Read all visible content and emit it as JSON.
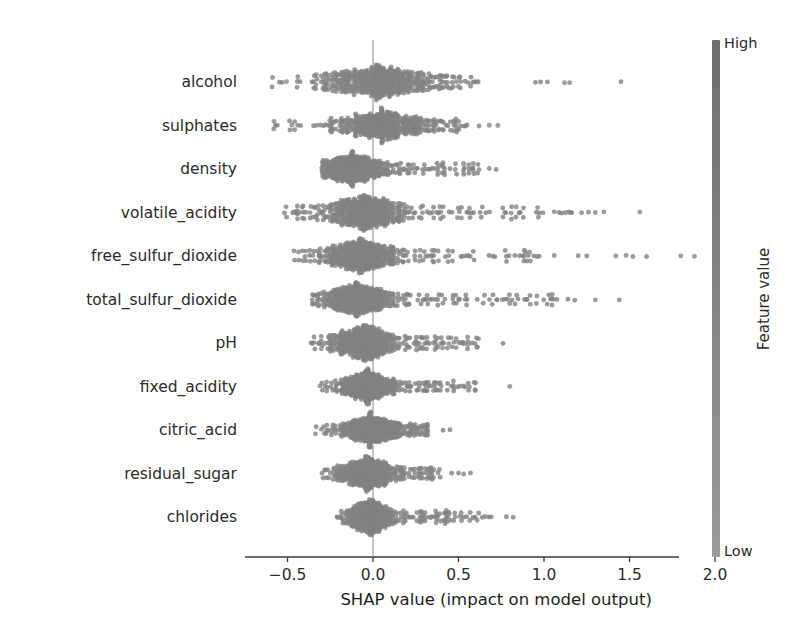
{
  "chart_data": {
    "type": "scatter",
    "plot_kind": "shap-beeswarm",
    "title": "",
    "xlabel": "SHAP value (impact on model output)",
    "ylabel": "",
    "xlim": [
      -0.78,
      2.02
    ],
    "xticks": [
      -0.5,
      0.0,
      0.5,
      1.0,
      1.5,
      2.0
    ],
    "xticklabels": [
      "−0.5",
      "0.0",
      "0.5",
      "1.0",
      "1.5",
      "2.0"
    ],
    "grid": false,
    "zero_line": 0.0,
    "point_color": "#808080",
    "colormap": "gray",
    "colorbar": {
      "label": "Feature value",
      "high_label": "High",
      "low_label": "Low",
      "top_color": "#6e6e6e",
      "bottom_color": "#9a9a9a"
    },
    "categories": [
      "alcohol",
      "sulphates",
      "density",
      "volatile_acidity",
      "free_sulfur_dioxide",
      "total_sulfur_dioxide",
      "pH",
      "fixed_acidity",
      "citric_acid",
      "residual_sugar",
      "chlorides"
    ],
    "series": [
      {
        "name": "alcohol",
        "min": -0.72,
        "max": 1.45,
        "core_min": -0.45,
        "core_max": 0.38,
        "body_min": -0.62,
        "body_max": 0.62,
        "spread": 0.3,
        "density_peak": 0.02,
        "n": 520,
        "outliers": [
          0.95,
          0.98,
          1.02,
          1.12,
          1.15,
          1.45
        ]
      },
      {
        "name": "sulphates",
        "min": -0.67,
        "max": 0.73,
        "core_min": -0.38,
        "core_max": 0.3,
        "body_min": -0.62,
        "body_max": 0.55,
        "spread": 0.25,
        "density_peak": 0.05,
        "n": 520,
        "outliers": [
          0.62,
          0.68,
          0.73
        ]
      },
      {
        "name": "density",
        "min": -0.32,
        "max": 0.72,
        "core_min": -0.24,
        "core_max": 0.18,
        "body_min": -0.3,
        "body_max": 0.62,
        "spread": 0.17,
        "density_peak": -0.12,
        "n": 520,
        "outliers": [
          0.68,
          0.72
        ]
      },
      {
        "name": "volatile_acidity",
        "min": -0.6,
        "max": 1.56,
        "core_min": -0.3,
        "core_max": 0.12,
        "body_min": -0.55,
        "body_max": 1.18,
        "spread": 0.22,
        "density_peak": -0.05,
        "n": 520,
        "outliers": [
          1.22,
          1.26,
          1.3,
          1.35,
          1.56
        ]
      },
      {
        "name": "free_sulfur_dioxide",
        "min": -0.54,
        "max": 1.9,
        "core_min": -0.28,
        "core_max": 0.1,
        "body_min": -0.5,
        "body_max": 0.98,
        "spread": 0.2,
        "density_peak": -0.08,
        "n": 520,
        "outliers": [
          1.06,
          1.2,
          1.25,
          1.42,
          1.48,
          1.52,
          1.6,
          1.8,
          1.88
        ]
      },
      {
        "name": "total_sulfur_dioxide",
        "min": -0.4,
        "max": 1.45,
        "core_min": -0.24,
        "core_max": 0.14,
        "body_min": -0.36,
        "body_max": 1.08,
        "spread": 0.18,
        "density_peak": -0.1,
        "n": 520,
        "outliers": [
          1.14,
          1.18,
          1.3,
          1.44
        ]
      },
      {
        "name": "pH",
        "min": -0.42,
        "max": 0.76,
        "core_min": -0.24,
        "core_max": 0.14,
        "body_min": -0.38,
        "body_max": 0.62,
        "spread": 0.17,
        "density_peak": -0.06,
        "n": 520,
        "outliers": [
          0.76
        ]
      },
      {
        "name": "fixed_acidity",
        "min": -0.36,
        "max": 0.82,
        "core_min": -0.2,
        "core_max": 0.12,
        "body_min": -0.32,
        "body_max": 0.6,
        "spread": 0.15,
        "density_peak": -0.04,
        "n": 520,
        "outliers": [
          0.8
        ]
      },
      {
        "name": "citric_acid",
        "min": -0.38,
        "max": 0.45,
        "core_min": -0.22,
        "core_max": 0.14,
        "body_min": -0.34,
        "body_max": 0.32,
        "spread": 0.16,
        "density_peak": -0.02,
        "n": 520,
        "outliers": [
          0.41,
          0.45
        ]
      },
      {
        "name": "residual_sugar",
        "min": -0.34,
        "max": 0.58,
        "core_min": -0.2,
        "core_max": 0.14,
        "body_min": -0.3,
        "body_max": 0.4,
        "spread": 0.15,
        "density_peak": -0.04,
        "n": 520,
        "outliers": [
          0.46,
          0.5,
          0.53,
          0.57
        ]
      },
      {
        "name": "chlorides",
        "min": -0.24,
        "max": 0.82,
        "core_min": -0.14,
        "core_max": 0.1,
        "body_min": -0.22,
        "body_max": 0.7,
        "spread": 0.12,
        "density_peak": -0.02,
        "n": 520,
        "outliers": [
          0.78,
          0.82
        ]
      }
    ]
  },
  "axes": {
    "x_tick_labels": [
      "−0.5",
      "0.0",
      "0.5",
      "1.0",
      "1.5",
      "2.0"
    ],
    "x_title": "SHAP value (impact on model output)"
  },
  "colorbar": {
    "title": "Feature value",
    "high": "High",
    "low": "Low"
  },
  "features": {
    "f0": "alcohol",
    "f1": "sulphates",
    "f2": "density",
    "f3": "volatile_acidity",
    "f4": "free_sulfur_dioxide",
    "f5": "total_sulfur_dioxide",
    "f6": "pH",
    "f7": "fixed_acidity",
    "f8": "citric_acid",
    "f9": "residual_sugar",
    "f10": "chlorides"
  }
}
